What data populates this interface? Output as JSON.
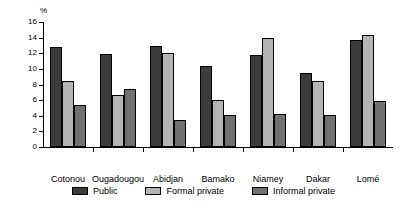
{
  "chart_data": {
    "type": "bar",
    "title": "",
    "subtitle": "",
    "xlabel": "",
    "ylabel": "%",
    "unit_label": "%",
    "ylim": [
      0,
      16
    ],
    "ytick_step": 2,
    "yticks": [
      0,
      2,
      4,
      6,
      8,
      10,
      12,
      14,
      16
    ],
    "ytick_labels": [
      "0",
      "2",
      "4",
      "6",
      "8",
      "10",
      "12",
      "14",
      "16"
    ],
    "grid": false,
    "legend_position": "bottom",
    "categories": [
      "Cotonou",
      "Ougadougou",
      "Abidjan",
      "Bamako",
      "Niamey",
      "Dakar",
      "Lomé"
    ],
    "series": [
      {
        "name": "Public",
        "color": "#3c3c3c",
        "values": [
          12.8,
          11.9,
          12.9,
          10.4,
          11.8,
          9.5,
          13.7
        ]
      },
      {
        "name": "Formal private",
        "color": "#b4b4b4",
        "values": [
          8.4,
          6.6,
          12.0,
          6.0,
          13.9,
          8.4,
          14.3
        ]
      },
      {
        "name": "Informal private",
        "color": "#707070",
        "values": [
          5.4,
          7.4,
          3.5,
          4.1,
          4.2,
          4.1,
          5.9
        ]
      }
    ],
    "annotations": []
  }
}
